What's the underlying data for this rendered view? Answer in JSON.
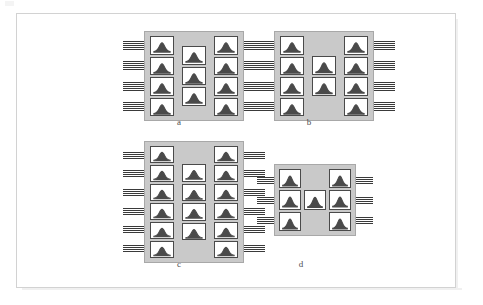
{
  "page": {
    "background_color": "#ffffff",
    "frame_color": "#d2d2d2",
    "substrate_color": "#c9c9c9",
    "cell_fill_color": "#ffffff",
    "cell_border_color": "#4a4a4a",
    "lead_color": "#3a3a3a",
    "caption_color": "#4d4d4d"
  },
  "figure": {
    "kind": "chip-floorplan-comparison",
    "panel_count": 4,
    "cell_glyph_name": "arch-peak-glyph"
  },
  "panels": [
    {
      "id": "a",
      "label": "a",
      "left_column_cells": 4,
      "middle_column_cells": 3,
      "right_column_cells": 4,
      "leads_per_row": 5,
      "total_cells": 11
    },
    {
      "id": "b",
      "label": "b",
      "left_column_cells": 4,
      "middle_column_cells": 2,
      "right_column_cells": 4,
      "leads_per_row": 5,
      "total_cells": 10
    },
    {
      "id": "c",
      "label": "c",
      "left_column_cells": 6,
      "middle_column_cells": 4,
      "right_column_cells": 6,
      "leads_per_row": 4,
      "total_cells": 16
    },
    {
      "id": "d",
      "label": "d",
      "left_column_cells": 3,
      "middle_column_cells": 1,
      "right_column_cells": 3,
      "leads_per_row": 4,
      "total_cells": 7
    }
  ]
}
